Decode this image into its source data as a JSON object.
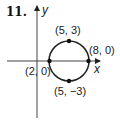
{
  "problem": {
    "number": "11."
  },
  "axes": {
    "x_label": "x",
    "y_label": "y"
  },
  "points": [
    {
      "id": "top",
      "label": "(5, 3)",
      "x": 5,
      "y": 3
    },
    {
      "id": "right",
      "label": "(8, 0)",
      "x": 8,
      "y": 0
    },
    {
      "id": "left",
      "label": "(2, 0)",
      "x": 2,
      "y": 0
    },
    {
      "id": "bottom",
      "label": "(5, −3)",
      "x": 5,
      "y": -3
    }
  ],
  "circle": {
    "center": [
      5,
      0
    ],
    "radius": 3
  },
  "colors": {
    "ink": "#222222",
    "background": "#ffffff"
  }
}
